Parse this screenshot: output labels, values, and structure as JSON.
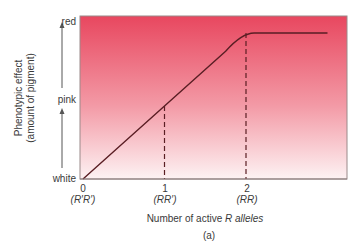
{
  "chart_data": {
    "type": "line",
    "title": "",
    "caption": "(a)",
    "xlabel_prefix": "Number of active ",
    "xlabel_italic": "R alleles",
    "ylabel_line1": "Phenotypic effect",
    "ylabel_line2": "(amount of pigment)",
    "x_ticks": [
      {
        "value": 0,
        "label": "0",
        "genotype": "(R′R′)"
      },
      {
        "value": 1,
        "label": "1",
        "genotype": "(RR′)"
      },
      {
        "value": 2,
        "label": "2",
        "genotype": "(RR)"
      }
    ],
    "y_ticks": [
      {
        "value": 0,
        "label": "white"
      },
      {
        "value": 0.5,
        "label": "pink"
      },
      {
        "value": 1,
        "label": "red"
      }
    ],
    "xlim": [
      0,
      3.3
    ],
    "ylim": [
      0,
      1.12
    ],
    "series": [
      {
        "name": "phenotypic effect",
        "x": [
          0,
          1,
          1.85,
          2,
          3.0
        ],
        "y": [
          0,
          0.5,
          0.98,
          1.0,
          1.0
        ]
      }
    ],
    "reference_lines": [
      {
        "x": 1,
        "y": 0.5,
        "style": "dashed"
      },
      {
        "x": 2,
        "y": 1.0,
        "style": "dashed"
      }
    ],
    "background_gradient": {
      "top": "#e8475f",
      "bottom": "#fdf2f3"
    },
    "line_color": "#5a1e24",
    "grid": false,
    "legend": "none"
  }
}
